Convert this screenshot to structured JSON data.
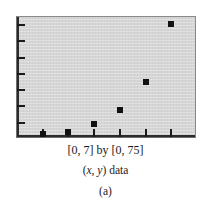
{
  "figure": {
    "top_clipped_text": ". . .",
    "captions": {
      "range": "[0, 7] by [0, 75]",
      "label_prefix": "(",
      "label_x": "x",
      "label_comma": ", ",
      "label_y": "y",
      "label_suffix": ") data",
      "label_full": "(x, y) data",
      "panel": "(a)"
    },
    "colors": {
      "plot_background": "#d5d5d5",
      "plot_border": "#8a8a8a",
      "axis": "#2b2b2b",
      "marker": "#111111",
      "page_background": "#ffffff",
      "text": "#1a1a1a"
    }
  },
  "chart_data": {
    "type": "scatter",
    "title": "",
    "subtitle": "",
    "xlabel": "",
    "ylabel": "",
    "caption": "(x, y) data",
    "panel_letter": "(a)",
    "window_text": "[0, 7] by [0, 75]",
    "xlim": [
      0,
      7
    ],
    "ylim": [
      0,
      75
    ],
    "grid": false,
    "legend": null,
    "xticks": [
      1,
      2,
      3,
      4,
      5,
      6
    ],
    "yticks": [
      10,
      20,
      30,
      40,
      50,
      60,
      70
    ],
    "xtick_labels": [],
    "ytick_labels": [],
    "x": [
      1,
      2,
      3,
      4,
      5,
      6
    ],
    "y": [
      3,
      4,
      9,
      18,
      35,
      71
    ],
    "points": [
      {
        "x": 1,
        "y": 3
      },
      {
        "x": 2,
        "y": 4
      },
      {
        "x": 3,
        "y": 9
      },
      {
        "x": 4,
        "y": 18
      },
      {
        "x": 5,
        "y": 35
      },
      {
        "x": 6,
        "y": 71
      }
    ],
    "marker": "square",
    "marker_color": "#111111",
    "marker_size": 6
  }
}
